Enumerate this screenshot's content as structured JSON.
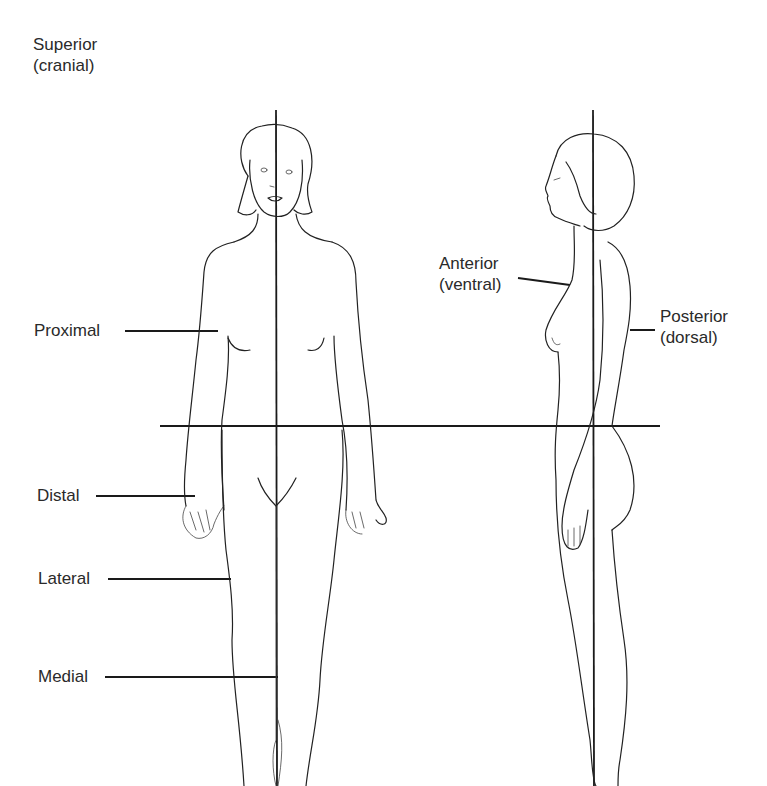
{
  "diagram": {
    "labels": {
      "superior": {
        "term": "Superior",
        "alt": "(cranial)"
      },
      "proximal": {
        "term": "Proximal"
      },
      "distal": {
        "term": "Distal"
      },
      "lateral": {
        "term": "Lateral"
      },
      "medial": {
        "term": "Medial"
      },
      "anterior": {
        "term": "Anterior",
        "alt": "(ventral)"
      },
      "posterior": {
        "term": "Posterior",
        "alt": "(dorsal)"
      }
    },
    "figures": [
      {
        "id": "front-view",
        "description": "Female figure, anterior view, with vertical midline (median plane)"
      },
      {
        "id": "side-view",
        "description": "Female figure, lateral (profile) view, with vertical coronal line"
      }
    ],
    "reference_lines": [
      {
        "id": "horizontal-plane",
        "orientation": "horizontal",
        "y": 426
      },
      {
        "id": "midline-front",
        "orientation": "vertical",
        "x": 276
      },
      {
        "id": "midline-side",
        "orientation": "vertical",
        "x": 593
      }
    ],
    "colors": {
      "line": "#1a1a1a",
      "text": "#2a2a2a",
      "background": "#ffffff"
    }
  }
}
